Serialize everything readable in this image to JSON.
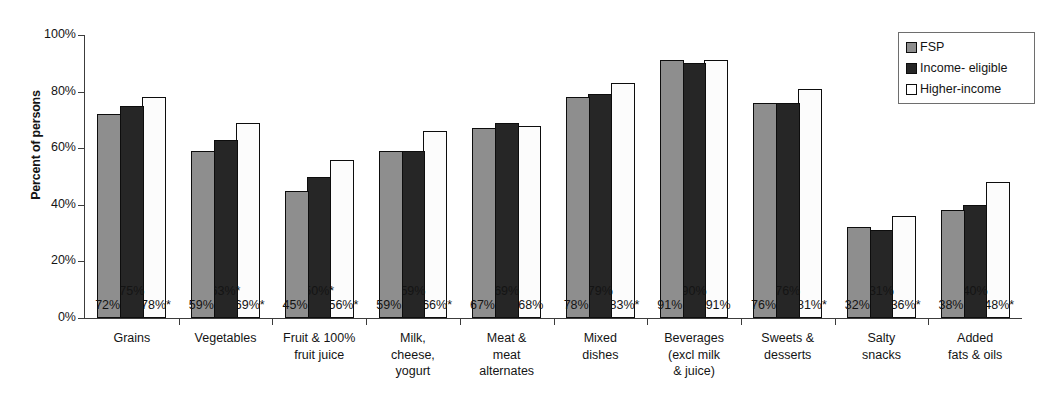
{
  "chart_data": {
    "type": "bar",
    "title": "",
    "xlabel": "",
    "ylabel": "Percent of persons",
    "ylim": [
      0,
      100
    ],
    "ytick_labels": [
      "100%",
      "80%",
      "60%",
      "40%",
      "20%",
      "0%"
    ],
    "ytick_values": [
      100,
      80,
      60,
      40,
      20,
      0
    ],
    "grid": false,
    "legend_position": "top-right",
    "categories": [
      "Grains",
      "Vegetables",
      "Fruit & 100% fruit juice",
      "Milk, cheese, yogurt",
      "Meat & meat alternates",
      "Mixed dishes",
      "Beverages (excl milk & juice)",
      "Sweets & desserts",
      "Salty snacks",
      "Added fats & oils"
    ],
    "category_lines": [
      [
        "Grains"
      ],
      [
        "Vegetables"
      ],
      [
        "Fruit & 100%",
        "fruit juice"
      ],
      [
        "Milk,",
        "cheese,",
        "yogurt"
      ],
      [
        "Meat &",
        "meat",
        "alternates"
      ],
      [
        "Mixed",
        "dishes"
      ],
      [
        "Beverages",
        "(excl milk",
        "& juice)"
      ],
      [
        "Sweets &",
        "desserts"
      ],
      [
        "Salty",
        "snacks"
      ],
      [
        "Added",
        "fats & oils"
      ]
    ],
    "series": [
      {
        "name": "FSP",
        "color": "#8e8e8e",
        "values": [
          72,
          59,
          45,
          59,
          67,
          78,
          91,
          76,
          32,
          38
        ],
        "labels": [
          "72%",
          "59%",
          "45%",
          "59%",
          "67%",
          "78%",
          "91%",
          "76%",
          "32%",
          "38%"
        ]
      },
      {
        "name": "Income- eligible",
        "color": "#262626",
        "values": [
          75,
          63,
          50,
          59,
          69,
          79,
          90,
          76,
          31,
          40
        ],
        "labels": [
          "75%",
          "63%*",
          "50%*",
          "59%",
          "69%",
          "79%",
          "90%",
          "76%",
          "31%",
          "40%"
        ]
      },
      {
        "name": "Higher-income",
        "color": "#ffffff",
        "values": [
          78,
          69,
          56,
          66,
          68,
          83,
          91,
          81,
          36,
          48
        ],
        "labels": [
          "78%*",
          "69%*",
          "56%*",
          "66%*",
          "68%",
          "83%*",
          "91%",
          "81%*",
          "36%*",
          "48%*"
        ]
      }
    ],
    "footnote_marker": "*"
  },
  "legend": {
    "items": [
      {
        "label": "FSP"
      },
      {
        "label": "Income- eligible"
      },
      {
        "label": "Higher-income"
      }
    ]
  }
}
